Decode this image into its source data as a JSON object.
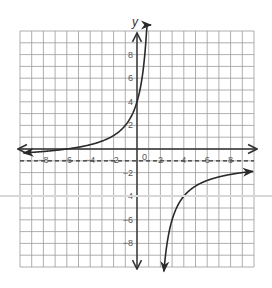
{
  "chart_data": {
    "type": "line",
    "title": "",
    "xlabel": "",
    "ylabel": "y",
    "xlim": [
      -10,
      10
    ],
    "ylim": [
      -10,
      10
    ],
    "grid": true,
    "x_ticks": [
      -8,
      -6,
      -4,
      -2,
      2,
      4,
      6,
      8
    ],
    "y_ticks": [
      8,
      6,
      4,
      2,
      -2,
      -4,
      -6,
      -8
    ],
    "origin_label": "0",
    "function": "y = -7.5/(x - 1.5) - 1",
    "asymptotes": {
      "horizontal": {
        "y": -1,
        "style": "dashed"
      },
      "vertical": {
        "x": 1.5,
        "style": "none"
      }
    },
    "series": [
      {
        "name": "left-branch",
        "points": [
          [
            -9.7,
            -0.32
          ],
          [
            -8,
            -0.21
          ],
          [
            -6,
            0
          ],
          [
            -4,
            0.36
          ],
          [
            -2,
            1.14
          ],
          [
            -1,
            2
          ],
          [
            0,
            4
          ],
          [
            0.5,
            6.5
          ],
          [
            1,
            14
          ]
        ]
      },
      {
        "name": "right-branch",
        "points": [
          [
            2.3,
            -10.4
          ],
          [
            3,
            -6
          ],
          [
            4,
            -4
          ],
          [
            6,
            -2.67
          ],
          [
            8,
            -2.15
          ],
          [
            10,
            -1.88
          ]
        ]
      }
    ],
    "key_points": [
      [
        0,
        4
      ],
      [
        -6,
        0
      ],
      [
        4,
        -4
      ]
    ]
  },
  "colors": {
    "grid": "#9a9a9a",
    "axis": "#333333",
    "curve": "#2a2a2a",
    "label": "#555555"
  }
}
